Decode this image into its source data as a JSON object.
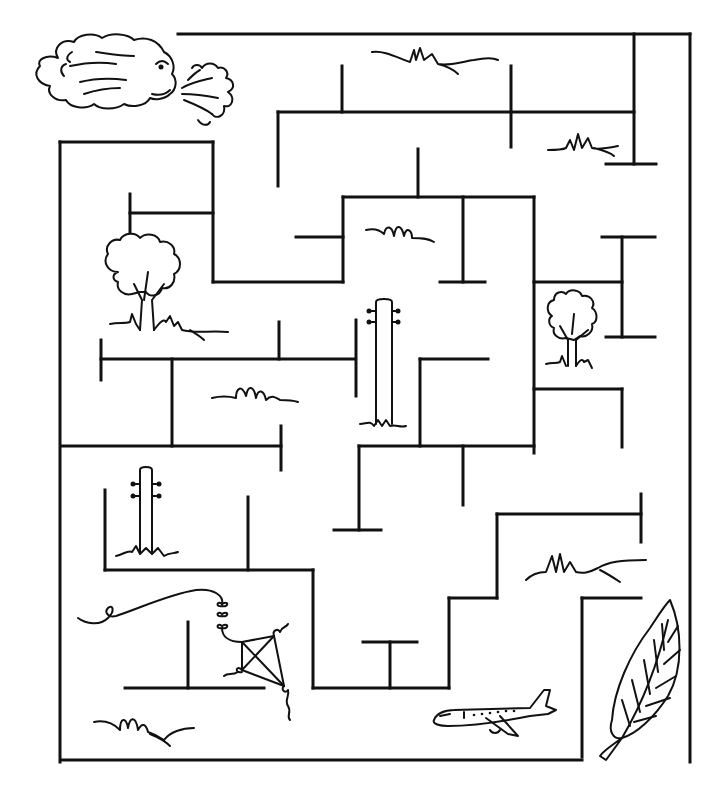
{
  "puzzle": {
    "type": "maze",
    "ink_color": "#111111",
    "background_color": "#ffffff",
    "start_item": "wind-cloud",
    "goal_items": [
      "leaf",
      "airplane",
      "kite"
    ]
  },
  "walls": [
    [
      178,
      34,
      690,
      34
    ],
    [
      690,
      34,
      690,
      762
    ],
    [
      634,
      34,
      634,
      164
    ],
    [
      606,
      164,
      656,
      164
    ],
    [
      278,
      112,
      634,
      112
    ],
    [
      278,
      112,
      278,
      186
    ],
    [
      342,
      66,
      342,
      112
    ],
    [
      511,
      66,
      511,
      147
    ],
    [
      60,
      142,
      213,
      142
    ],
    [
      60,
      142,
      60,
      762
    ],
    [
      213,
      142,
      213,
      282
    ],
    [
      130,
      194,
      130,
      236
    ],
    [
      130,
      213,
      213,
      213
    ],
    [
      213,
      282,
      343,
      282
    ],
    [
      343,
      197,
      343,
      282
    ],
    [
      296,
      237,
      343,
      237
    ],
    [
      343,
      197,
      534,
      197
    ],
    [
      418,
      149,
      418,
      197
    ],
    [
      463,
      197,
      463,
      282
    ],
    [
      440,
      282,
      485,
      282
    ],
    [
      534,
      197,
      534,
      453
    ],
    [
      534,
      282,
      622,
      282
    ],
    [
      622,
      237,
      622,
      337
    ],
    [
      602,
      237,
      655,
      237
    ],
    [
      606,
      337,
      655,
      337
    ],
    [
      534,
      389,
      622,
      389
    ],
    [
      622,
      389,
      622,
      447
    ],
    [
      101,
      359,
      355,
      359
    ],
    [
      101,
      340,
      101,
      380
    ],
    [
      172,
      359,
      172,
      446
    ],
    [
      279,
      322,
      279,
      359
    ],
    [
      356,
      320,
      356,
      396
    ],
    [
      62,
      446,
      281,
      446
    ],
    [
      281,
      426,
      281,
      470
    ],
    [
      420,
      359,
      488,
      359
    ],
    [
      420,
      359,
      420,
      446
    ],
    [
      359,
      446,
      534,
      446
    ],
    [
      359,
      446,
      359,
      530
    ],
    [
      334,
      530,
      381,
      530
    ],
    [
      463,
      446,
      463,
      505
    ],
    [
      105,
      490,
      105,
      570
    ],
    [
      105,
      570,
      313,
      570
    ],
    [
      248,
      497,
      248,
      570
    ],
    [
      313,
      570,
      313,
      688
    ],
    [
      313,
      688,
      449,
      688
    ],
    [
      390,
      642,
      390,
      688
    ],
    [
      363,
      642,
      417,
      642
    ],
    [
      449,
      598,
      449,
      688
    ],
    [
      449,
      598,
      497,
      598
    ],
    [
      497,
      514,
      497,
      598
    ],
    [
      497,
      514,
      641,
      514
    ],
    [
      641,
      494,
      641,
      542
    ],
    [
      582,
      598,
      641,
      598
    ],
    [
      582,
      598,
      582,
      757
    ],
    [
      125,
      688,
      264,
      688
    ],
    [
      188,
      622,
      188,
      688
    ],
    [
      62,
      760,
      582,
      760
    ]
  ],
  "illustrations": [
    {
      "name": "wind-cloud",
      "label": "Blowing wind cloud"
    },
    {
      "name": "tree-left",
      "label": "Tree"
    },
    {
      "name": "tree-right",
      "label": "Tree"
    },
    {
      "name": "pole-center",
      "label": "Telephone pole"
    },
    {
      "name": "pole-left",
      "label": "Telephone pole"
    },
    {
      "name": "kite",
      "label": "Kite"
    },
    {
      "name": "airplane",
      "label": "Airplane"
    },
    {
      "name": "leaf",
      "label": "Leaf"
    },
    {
      "name": "grass-tufts",
      "label": "Grass"
    }
  ]
}
